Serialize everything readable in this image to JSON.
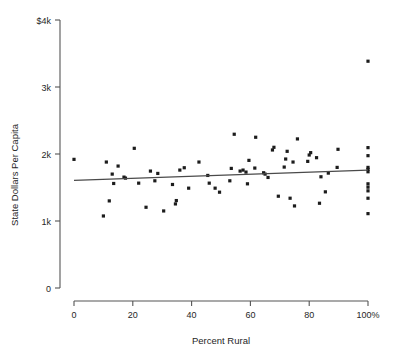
{
  "chart_data": {
    "type": "scatter",
    "title": "",
    "subtitle": "",
    "xlabel": "Percent Rural",
    "ylabel": "State Dollars Per Capita",
    "xlim": [
      0,
      100
    ],
    "ylim": [
      0,
      4000
    ],
    "grid": false,
    "legend": null,
    "x_ticks": [
      0,
      20,
      40,
      60,
      80,
      100
    ],
    "x_tick_labels": [
      "0",
      "20",
      "40",
      "60",
      "80",
      "100%"
    ],
    "y_ticks": [
      0,
      1000,
      2000,
      3000,
      4000
    ],
    "y_tick_labels": [
      "0",
      "1k",
      "2k",
      "3k",
      "$4k"
    ],
    "point_color": "#1c1c1c",
    "line_color": "#4a4a4a",
    "axis_color": "#555555",
    "series": [
      {
        "name": "States",
        "marker": "square",
        "points": [
          [
            0.0,
            1920
          ],
          [
            10.0,
            1075
          ],
          [
            11.0,
            1880
          ],
          [
            12.0,
            1300
          ],
          [
            13.0,
            1700
          ],
          [
            13.5,
            1560
          ],
          [
            15.0,
            1820
          ],
          [
            17.0,
            1655
          ],
          [
            17.5,
            1640
          ],
          [
            20.5,
            2085
          ],
          [
            22.0,
            1565
          ],
          [
            24.5,
            1205
          ],
          [
            26.0,
            1745
          ],
          [
            27.5,
            1600
          ],
          [
            28.5,
            1710
          ],
          [
            30.5,
            1150
          ],
          [
            33.5,
            1545
          ],
          [
            34.5,
            1255
          ],
          [
            34.8,
            1305
          ],
          [
            36.0,
            1760
          ],
          [
            37.5,
            1795
          ],
          [
            39.0,
            1490
          ],
          [
            42.5,
            1880
          ],
          [
            45.5,
            1680
          ],
          [
            46.0,
            1565
          ],
          [
            48.0,
            1490
          ],
          [
            49.5,
            1430
          ],
          [
            53.0,
            1600
          ],
          [
            53.5,
            1785
          ],
          [
            54.5,
            2295
          ],
          [
            56.5,
            1745
          ],
          [
            57.5,
            1760
          ],
          [
            58.5,
            1730
          ],
          [
            59.0,
            1555
          ],
          [
            59.5,
            1905
          ],
          [
            61.5,
            1790
          ],
          [
            61.8,
            2250
          ],
          [
            64.5,
            1720
          ],
          [
            65.0,
            1700
          ],
          [
            66.0,
            1650
          ],
          [
            67.5,
            2060
          ],
          [
            68.0,
            2100
          ],
          [
            69.5,
            1370
          ],
          [
            71.5,
            1805
          ],
          [
            72.0,
            1925
          ],
          [
            72.5,
            2040
          ],
          [
            73.5,
            1340
          ],
          [
            74.5,
            1880
          ],
          [
            75.0,
            1225
          ],
          [
            76.0,
            2225
          ],
          [
            79.5,
            1890
          ],
          [
            80.0,
            1985
          ],
          [
            80.5,
            2020
          ],
          [
            82.5,
            1945
          ],
          [
            83.5,
            1265
          ],
          [
            84.0,
            1660
          ],
          [
            85.5,
            1435
          ],
          [
            86.5,
            1715
          ],
          [
            89.5,
            1800
          ],
          [
            89.8,
            2070
          ],
          [
            100.0,
            3385
          ],
          [
            100.0,
            2095
          ],
          [
            100.0,
            1975
          ],
          [
            100.0,
            1800
          ],
          [
            100.0,
            1770
          ],
          [
            100.0,
            1735
          ],
          [
            100.0,
            1555
          ],
          [
            100.0,
            1505
          ],
          [
            100.0,
            1450
          ],
          [
            100.0,
            1340
          ],
          [
            100.0,
            1110
          ]
        ]
      }
    ],
    "trendline": {
      "name": "linear-fit",
      "x": [
        0,
        100
      ],
      "y": [
        1605,
        1760
      ]
    }
  }
}
